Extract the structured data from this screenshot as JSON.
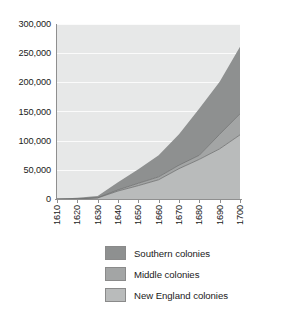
{
  "chart_data": {
    "type": "area",
    "title": "",
    "subtitle": "",
    "xlabel": "",
    "ylabel": "",
    "stacked": true,
    "grid": true,
    "legend_position": "bottom",
    "xlim": [
      1610,
      1700
    ],
    "ylim": [
      0,
      300000
    ],
    "x": [
      1610,
      1620,
      1630,
      1640,
      1650,
      1660,
      1670,
      1680,
      1690,
      1700
    ],
    "categories": [
      "1610",
      "1620",
      "1630",
      "1640",
      "1650",
      "1660",
      "1670",
      "1680",
      "1690",
      "1700"
    ],
    "x_tick_labels": [
      "1610",
      "1620",
      "1630",
      "1640",
      "1650",
      "1660",
      "1670",
      "1680",
      "1690",
      "1700"
    ],
    "y_tick_labels": [
      "0",
      "50,000",
      "100,000",
      "150,000",
      "200,000",
      "250,000",
      "300,000"
    ],
    "y_ticks": [
      0,
      50000,
      100000,
      150000,
      200000,
      250000,
      300000
    ],
    "series": [
      {
        "name": "New England colonies",
        "color": "#b9bbbb",
        "values": [
          0,
          200,
          1800,
          13700,
          22900,
          33000,
          52000,
          68000,
          86000,
          110000
        ]
      },
      {
        "name": "Middle colonies",
        "color": "#a3a5a5",
        "values": [
          0,
          0,
          400,
          1900,
          4100,
          5000,
          6000,
          7000,
          25000,
          36000
        ]
      },
      {
        "name": "Southern colonies",
        "color": "#8e9090",
        "values": [
          350,
          2100,
          3000,
          13000,
          24000,
          37000,
          53000,
          80000,
          90000,
          115000
        ]
      }
    ],
    "cumulative_totals": [
      350,
      2300,
      5200,
      28600,
      51000,
      75000,
      111000,
      155000,
      201000,
      261000
    ]
  },
  "legend": {
    "items": [
      {
        "label": "Southern colonies",
        "color": "#8e9090"
      },
      {
        "label": "Middle colonies",
        "color": "#a3a5a5"
      },
      {
        "label": "New England colonies",
        "color": "#b9bbbb"
      }
    ]
  },
  "axes": {
    "y_labels": [
      "300,000",
      "250,000",
      "200,000",
      "150,000",
      "100,000",
      "50,000",
      "0"
    ],
    "x_labels": [
      "1610",
      "1620",
      "1630",
      "1640",
      "1650",
      "1660",
      "1670",
      "1680",
      "1690",
      "1700"
    ]
  }
}
